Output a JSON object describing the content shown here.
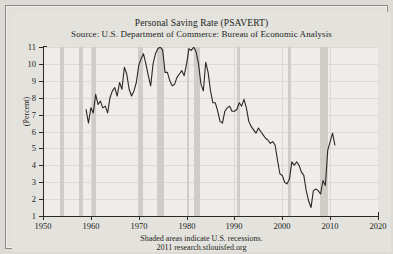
{
  "chart_data": {
    "type": "line",
    "title": "Personal Saving Rate (PSAVERT)",
    "subtitle": "Source: U.S. Department of Commerce: Bureau of Economic Analysis",
    "xlabel": "",
    "ylabel": "(Percent)",
    "xlim": [
      1950,
      2020
    ],
    "ylim": [
      1,
      11
    ],
    "xticks": [
      1950,
      1960,
      1970,
      1980,
      1990,
      2000,
      2010,
      2020
    ],
    "yticks": [
      1,
      2,
      3,
      4,
      5,
      6,
      7,
      8,
      9,
      10,
      11
    ],
    "grid": true,
    "legend": "none",
    "line_color": "#2b2926",
    "recession_band_color": "#cfcdc7",
    "plot_background": "#eeede9",
    "figure_background": "#e4e2dd",
    "footnote1": "Shaded areas indicate U.S. recessions.",
    "footnote2": "2011 research.stlouisfed.org",
    "recessions": [
      {
        "start": 1953.6,
        "end": 1954.4
      },
      {
        "start": 1957.6,
        "end": 1958.3
      },
      {
        "start": 1960.3,
        "end": 1961.1
      },
      {
        "start": 1969.9,
        "end": 1970.9
      },
      {
        "start": 1973.9,
        "end": 1975.2
      },
      {
        "start": 1980.0,
        "end": 1980.5
      },
      {
        "start": 1981.5,
        "end": 1982.9
      },
      {
        "start": 1990.5,
        "end": 1991.2
      },
      {
        "start": 2001.2,
        "end": 2001.9
      },
      {
        "start": 2007.9,
        "end": 2009.5
      }
    ],
    "x": [
      1959.0,
      1959.5,
      1960.0,
      1960.5,
      1961.0,
      1961.5,
      1962.0,
      1962.5,
      1963.0,
      1963.5,
      1964.0,
      1964.5,
      1965.0,
      1965.5,
      1966.0,
      1966.5,
      1967.0,
      1967.5,
      1968.0,
      1968.5,
      1969.0,
      1969.5,
      1970.0,
      1970.5,
      1971.0,
      1971.5,
      1972.0,
      1972.5,
      1973.0,
      1973.5,
      1974.0,
      1974.5,
      1975.0,
      1975.5,
      1976.0,
      1976.5,
      1977.0,
      1977.5,
      1978.0,
      1978.5,
      1979.0,
      1979.5,
      1980.0,
      1980.5,
      1981.0,
      1981.5,
      1982.0,
      1982.5,
      1983.0,
      1983.5,
      1984.0,
      1984.5,
      1985.0,
      1985.5,
      1986.0,
      1986.5,
      1987.0,
      1987.5,
      1988.0,
      1988.5,
      1989.0,
      1989.5,
      1990.0,
      1990.5,
      1991.0,
      1991.5,
      1992.0,
      1992.5,
      1993.0,
      1993.5,
      1994.0,
      1994.5,
      1995.0,
      1995.5,
      1996.0,
      1996.5,
      1997.0,
      1997.5,
      1998.0,
      1998.5,
      1999.0,
      1999.5,
      2000.0,
      2000.5,
      2001.0,
      2001.5,
      2002.0,
      2002.5,
      2003.0,
      2003.5,
      2004.0,
      2004.5,
      2005.0,
      2005.5,
      2006.0,
      2006.5,
      2007.0,
      2007.5,
      2008.0,
      2008.5,
      2009.0,
      2009.5,
      2010.0,
      2010.5,
      2011.0
    ],
    "y": [
      7.3,
      6.5,
      7.4,
      7.1,
      8.2,
      7.6,
      7.8,
      7.4,
      7.5,
      7.1,
      8.0,
      8.4,
      8.6,
      8.1,
      8.9,
      8.5,
      9.8,
      9.4,
      8.5,
      8.1,
      8.4,
      8.9,
      9.9,
      10.3,
      10.6,
      10.0,
      9.3,
      8.7,
      10.0,
      10.6,
      10.9,
      11.0,
      10.8,
      9.5,
      9.5,
      9.0,
      8.7,
      8.8,
      9.2,
      9.4,
      9.6,
      9.3,
      10.0,
      10.9,
      10.8,
      11.0,
      10.7,
      10.0,
      8.8,
      8.4,
      10.1,
      9.5,
      8.4,
      7.7,
      7.7,
      7.2,
      6.6,
      6.5,
      7.2,
      7.4,
      7.5,
      7.2,
      7.2,
      7.3,
      7.7,
      7.5,
      7.9,
      7.4,
      6.6,
      6.3,
      6.1,
      5.9,
      6.2,
      6.0,
      5.8,
      5.6,
      5.5,
      5.3,
      5.4,
      5.2,
      4.3,
      3.5,
      3.4,
      3.0,
      2.9,
      3.2,
      4.2,
      4.0,
      4.2,
      4.0,
      3.6,
      3.4,
      2.5,
      1.9,
      1.5,
      2.5,
      2.6,
      2.5,
      2.3,
      3.1,
      2.8,
      4.9,
      5.4,
      5.9,
      5.2,
      5.5,
      5.3
    ],
    "notable_points": [
      {
        "label": "series start",
        "x": 1959.0,
        "y": 7.3
      },
      {
        "label": "peak mid-1970s",
        "x": 1975.0,
        "y": 11.0
      },
      {
        "label": "peak early-1980s",
        "x": 1982.0,
        "y": 11.0
      },
      {
        "label": "trough mid-2000s",
        "x": 2005.5,
        "y": 1.5
      },
      {
        "label": "post-recession rise",
        "x": 2010.0,
        "y": 5.9
      }
    ]
  }
}
